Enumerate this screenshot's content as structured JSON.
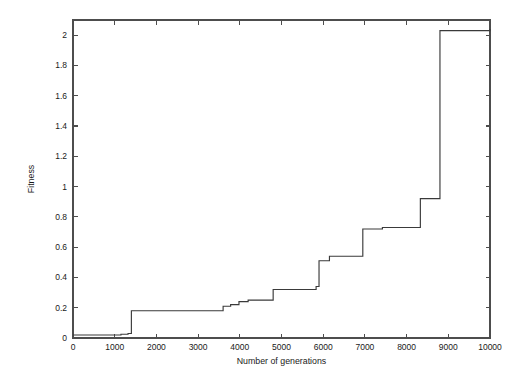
{
  "figure": {
    "background": "#ffffff",
    "line_color": "#3a3a3a",
    "axis_color": "#4d4d4d"
  },
  "labels": {
    "xlabel": "Number of generations",
    "ylabel": "Fitness"
  },
  "chart_data": {
    "type": "line",
    "title": "",
    "subtitle": "",
    "xlabel": "Number of generations",
    "ylabel": "Fitness",
    "xlim": [
      0,
      10000
    ],
    "ylim": [
      0,
      2.1
    ],
    "xticks": [
      0,
      1000,
      2000,
      3000,
      4000,
      5000,
      6000,
      7000,
      8000,
      9000,
      10000
    ],
    "xticklabels": [
      "0",
      "1000",
      "2000",
      "3000",
      "4000",
      "5000",
      "6000",
      "7000",
      "8000",
      "9000",
      "10000"
    ],
    "yticks": [
      0,
      0.2,
      0.4,
      0.6,
      0.8,
      1,
      1.2,
      1.4,
      1.6,
      1.8,
      2
    ],
    "yticklabels": [
      "0",
      "0.2",
      "0.4",
      "0.6",
      "0.8",
      "1",
      "1.2",
      "1.4",
      "1.6",
      "1.8",
      "2"
    ],
    "grid": false,
    "legend": false,
    "legend_position": "none",
    "step_style": "post",
    "series": [
      {
        "name": "best fitness",
        "x": [
          0,
          1100,
          1150,
          1270,
          1320,
          1380,
          1400,
          3560,
          3600,
          3700,
          3780,
          3900,
          3980,
          4150,
          4200,
          4750,
          4800,
          5780,
          5830,
          5870,
          5900,
          6100,
          6150,
          6900,
          6950,
          7380,
          7420,
          8280,
          8330,
          8750,
          8800,
          9900,
          10000
        ],
        "y": [
          0.02,
          0.02,
          0.025,
          0.025,
          0.03,
          0.03,
          0.18,
          0.18,
          0.21,
          0.21,
          0.22,
          0.22,
          0.24,
          0.24,
          0.25,
          0.25,
          0.32,
          0.32,
          0.34,
          0.34,
          0.51,
          0.51,
          0.54,
          0.54,
          0.72,
          0.72,
          0.73,
          0.73,
          0.92,
          0.92,
          2.03,
          2.03,
          2.04
        ]
      }
    ],
    "annotations": []
  }
}
